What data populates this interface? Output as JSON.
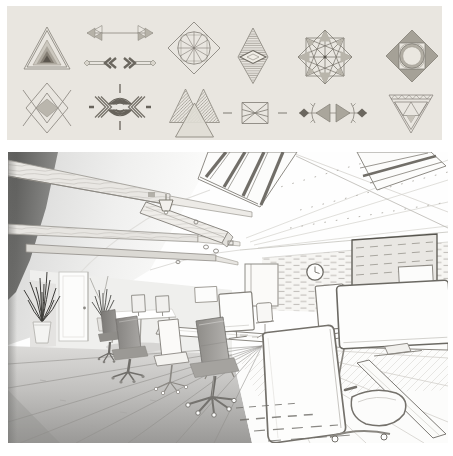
{
  "colors": {
    "page_bg": "#ffffff",
    "sheet_bg": "#e9e6e0",
    "scene_bg": "#fefefe",
    "ink_light": "#9a968e",
    "ink_mid": "#7b776f",
    "ink_dark": "#55524c",
    "sketch_line": "#7d7a74",
    "photo_gray_dark": "#6e6e6c",
    "photo_gray_mid": "#a8a8a6",
    "photo_gray_light": "#dddddc"
  },
  "design_sheet": {
    "name": "geometric line-art design set",
    "rows": 2,
    "columns": 6,
    "designs": [
      {
        "id": "nested-triangle",
        "label": "concentric shaded triangle"
      },
      {
        "id": "arrow-dividers",
        "label": "tribal arrow divider pair"
      },
      {
        "id": "diamond-wheel",
        "label": "diamond with spoked circle"
      },
      {
        "id": "striped-lozenge",
        "label": "hatched vertical lozenge with center lens"
      },
      {
        "id": "star-mandala",
        "label": "eight-point star mandala web"
      },
      {
        "id": "diamond-ring",
        "label": "diamond with ring and shaded corner triangles"
      },
      {
        "id": "zigzag-diamond",
        "label": "diamond with crossing chevrons and center diamond"
      },
      {
        "id": "hourglass-arrows",
        "label": "striped hourglass with inward chevron arrows"
      },
      {
        "id": "overlap-triangles",
        "label": "three overlapping hatched triangles"
      },
      {
        "id": "bowtie",
        "label": "wireframe bowtie with side dashes"
      },
      {
        "id": "triangle-diamond-divider",
        "label": "outward triangles with arcs and dark diamonds"
      },
      {
        "id": "truss-triangle",
        "label": "inverted triangle lattice"
      }
    ]
  },
  "office_sketch": {
    "name": "open-plan loft office, pencil-sketch render",
    "elements": [
      "dark corner wall wedge",
      "wood ceiling beams",
      "suspended beam slab",
      "pendant lamp",
      "ceiling spotlights",
      "skylight window left",
      "skylight window right",
      "vaulted plaster ceiling",
      "brick feature wall",
      "wall screen board",
      "wall clock",
      "glass door frame",
      "white entry door",
      "potted plants",
      "far white table",
      "long shared desk",
      "right shared desk",
      "desktop monitors",
      "swivel task chairs",
      "foreground chair back and seat",
      "wide-plank wood floor",
      "sketch floor hatching"
    ]
  }
}
